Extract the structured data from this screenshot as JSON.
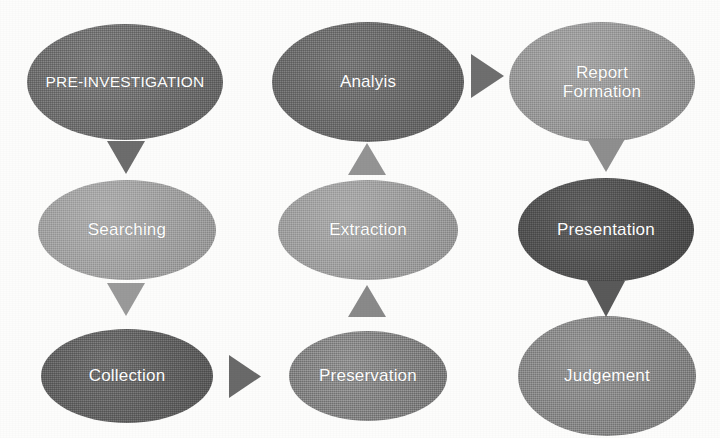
{
  "diagram": {
    "background_color": "#fdfdfc",
    "text_color": "#ffffff",
    "nodes": [
      {
        "id": "pre-investigation",
        "label": "PRE-INVESTIGATION",
        "label_line2": "",
        "color": "#6e6e6e",
        "x": 27,
        "y": 24,
        "w": 196,
        "h": 116,
        "font_size": 15.5
      },
      {
        "id": "analyis",
        "label": "Analyis",
        "label_line2": "",
        "color": "#6a6a6a",
        "x": 272,
        "y": 22,
        "w": 192,
        "h": 120,
        "font_size": 17
      },
      {
        "id": "report-formation",
        "label": "Report",
        "label_line2": "Formation",
        "color": "#9c9c9c",
        "x": 509,
        "y": 22,
        "w": 186,
        "h": 120,
        "font_size": 17
      },
      {
        "id": "searching",
        "label": "Searching",
        "label_line2": "",
        "color": "#a6a6a6",
        "x": 38,
        "y": 180,
        "w": 178,
        "h": 100,
        "font_size": 17
      },
      {
        "id": "extraction",
        "label": "Extraction",
        "label_line2": "",
        "color": "#a3a3a3",
        "x": 278,
        "y": 180,
        "w": 180,
        "h": 100,
        "font_size": 17
      },
      {
        "id": "presentation",
        "label": "Presentation",
        "label_line2": "",
        "color": "#4f4f4f",
        "x": 518,
        "y": 178,
        "w": 176,
        "h": 104,
        "font_size": 17
      },
      {
        "id": "collection",
        "label": "Collection",
        "label_line2": "",
        "color": "#616161",
        "x": 41,
        "y": 329,
        "w": 172,
        "h": 94,
        "font_size": 17
      },
      {
        "id": "preservation",
        "label": "Preservation",
        "label_line2": "",
        "color": "#858585",
        "x": 289,
        "y": 331,
        "w": 158,
        "h": 90,
        "font_size": 17
      },
      {
        "id": "judgement",
        "label": "Judgement",
        "label_line2": "",
        "color": "#8a8a8a",
        "x": 518,
        "y": 316,
        "w": 178,
        "h": 120,
        "font_size": 17
      }
    ],
    "arrows": [
      {
        "id": "pre-investigation-to-searching",
        "direction": "down",
        "color": "#6d6d6d",
        "x": 107,
        "y": 141,
        "w": 38,
        "h": 33
      },
      {
        "id": "searching-to-collection",
        "direction": "down",
        "color": "#9a9a9a",
        "x": 107,
        "y": 283,
        "w": 38,
        "h": 33
      },
      {
        "id": "collection-to-preservation",
        "direction": "right",
        "color": "#6a6a6a",
        "x": 229,
        "y": 355,
        "w": 32,
        "h": 43
      },
      {
        "id": "preservation-to-extraction",
        "direction": "up",
        "color": "#8a8a8a",
        "x": 348,
        "y": 285,
        "w": 38,
        "h": 32
      },
      {
        "id": "extraction-to-analyis",
        "direction": "up",
        "color": "#949494",
        "x": 348,
        "y": 143,
        "w": 38,
        "h": 32
      },
      {
        "id": "analyis-to-report-formation",
        "direction": "right",
        "color": "#6f6f6f",
        "x": 471,
        "y": 54,
        "w": 33,
        "h": 44
      },
      {
        "id": "report-formation-to-presentation",
        "direction": "down",
        "color": "#8f8f8f",
        "x": 587,
        "y": 139,
        "w": 38,
        "h": 33
      },
      {
        "id": "presentation-to-judgement",
        "direction": "down",
        "color": "#5a5a5a",
        "x": 587,
        "y": 281,
        "w": 38,
        "h": 36
      }
    ]
  }
}
